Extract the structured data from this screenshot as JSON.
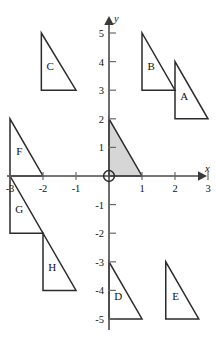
{
  "figure": {
    "axes": {
      "x_name": "x",
      "y_name": "y",
      "x_ticks": [
        "-3",
        "-2",
        "-1",
        "1",
        "2",
        "3"
      ],
      "y_ticks": [
        "5",
        "4",
        "3",
        "2",
        "1",
        "-1",
        "-2",
        "-3",
        "-4",
        "-5"
      ],
      "xlim": [
        -3.3,
        3.3
      ],
      "ylim": [
        -5.2,
        5.2
      ]
    },
    "origin_marker": "circle",
    "shaded_fill": "#d6d6d6",
    "outline_color": "#2b2b2b"
  },
  "chart_data": {
    "type": "scatter",
    "xlabel": "x",
    "ylabel": "y",
    "xlim": [
      -3.3,
      3.3
    ],
    "ylim": [
      -5.2,
      5.2
    ],
    "grid": false,
    "legend": "none",
    "x_ticks": [
      -3,
      -2,
      -1,
      1,
      2,
      3
    ],
    "y_ticks": [
      5,
      4,
      3,
      2,
      1,
      -1,
      -2,
      -3,
      -4,
      -5
    ],
    "shapes": [
      {
        "name": "shaded",
        "label": "",
        "shaded": true,
        "vertices": [
          [
            0,
            0
          ],
          [
            0,
            2
          ],
          [
            1,
            0
          ]
        ],
        "label_pos": [
          0,
          0
        ]
      },
      {
        "name": "A",
        "label": "A",
        "shaded": false,
        "vertices": [
          [
            2,
            2
          ],
          [
            2,
            4
          ],
          [
            3,
            2
          ]
        ],
        "label_pos": [
          2.28,
          2.65
        ]
      },
      {
        "name": "B",
        "label": "B",
        "shaded": false,
        "vertices": [
          [
            1,
            3
          ],
          [
            1,
            5
          ],
          [
            2,
            3
          ]
        ],
        "label_pos": [
          1.28,
          3.72
        ]
      },
      {
        "name": "C",
        "label": "C",
        "shaded": false,
        "vertices": [
          [
            -2.05,
            3
          ],
          [
            -2.05,
            5
          ],
          [
            -1.0,
            3
          ]
        ],
        "label_pos": [
          -1.78,
          3.72
        ]
      },
      {
        "name": "D",
        "label": "D",
        "shaded": false,
        "vertices": [
          [
            0,
            -5
          ],
          [
            0,
            -3
          ],
          [
            1,
            -5
          ]
        ],
        "label_pos": [
          0.28,
          -4.35
        ]
      },
      {
        "name": "E",
        "label": "E",
        "shaded": false,
        "vertices": [
          [
            1.72,
            -5
          ],
          [
            1.72,
            -3
          ],
          [
            2.72,
            -5
          ]
        ],
        "label_pos": [
          2.02,
          -4.35
        ]
      },
      {
        "name": "F",
        "label": "F",
        "shaded": false,
        "vertices": [
          [
            -3,
            0
          ],
          [
            -3,
            2
          ],
          [
            -2,
            0
          ]
        ],
        "label_pos": [
          -2.72,
          0.72
        ]
      },
      {
        "name": "G",
        "label": "G",
        "shaded": false,
        "vertices": [
          [
            -3,
            -2
          ],
          [
            -3,
            0
          ],
          [
            -2,
            -2
          ]
        ],
        "label_pos": [
          -2.72,
          -1.3
        ]
      },
      {
        "name": "H",
        "label": "H",
        "shaded": false,
        "vertices": [
          [
            -2,
            -4
          ],
          [
            -2,
            -2
          ],
          [
            -1,
            -4
          ]
        ],
        "label_pos": [
          -1.72,
          -3.32
        ]
      }
    ]
  }
}
